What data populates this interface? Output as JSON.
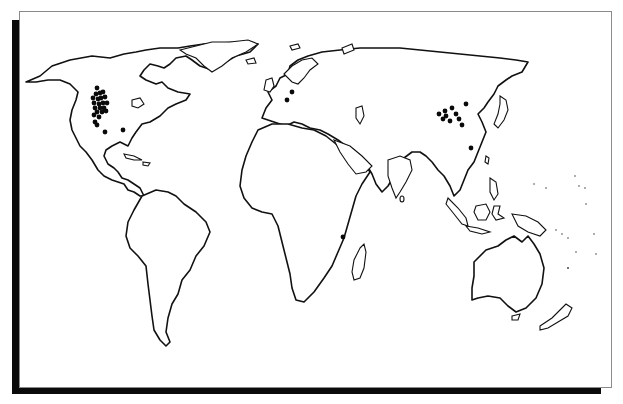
{
  "figure": {
    "type": "world-outline-map",
    "style": "black-and-white line drawing with drop-shadow frame",
    "colors": {
      "background": "#ffffff",
      "outline": "#111111",
      "markers": "#0a0a0a",
      "shadow": "#0a0a0a",
      "border": "#8a8a8a"
    }
  },
  "markers": {
    "description": "Black dot markers indicating site locations",
    "regions": [
      {
        "region": "North America - western interior (Rocky Mountain / Great Plains cluster)",
        "count": 24
      },
      {
        "region": "North America - south-central US",
        "count": 2
      },
      {
        "region": "Europe - northern Italy / Alps",
        "count": 2
      },
      {
        "region": "East Asia - northern China / Mongolia cluster",
        "count": 10
      },
      {
        "region": "East Asia - southeastern China",
        "count": 1
      },
      {
        "region": "Africa - southeastern (Mozambique / Malawi)",
        "count": 1
      }
    ],
    "points": [
      [
        97,
        88
      ],
      [
        96,
        94
      ],
      [
        100,
        93
      ],
      [
        103,
        92
      ],
      [
        93,
        98
      ],
      [
        98,
        99
      ],
      [
        101,
        98
      ],
      [
        105,
        97
      ],
      [
        94,
        103
      ],
      [
        99,
        104
      ],
      [
        103,
        103
      ],
      [
        107,
        103
      ],
      [
        95,
        108
      ],
      [
        100,
        108
      ],
      [
        104,
        108
      ],
      [
        97,
        112
      ],
      [
        102,
        112
      ],
      [
        106,
        111
      ],
      [
        94,
        115
      ],
      [
        99,
        117
      ],
      [
        95,
        122
      ],
      [
        97,
        125
      ],
      [
        105,
        132
      ],
      [
        123,
        130
      ],
      [
        292,
        92
      ],
      [
        287,
        100
      ],
      [
        439,
        114
      ],
      [
        445,
        111
      ],
      [
        446,
        116
      ],
      [
        452,
        108
      ],
      [
        456,
        114
      ],
      [
        443,
        119
      ],
      [
        450,
        121
      ],
      [
        459,
        119
      ],
      [
        466,
        104
      ],
      [
        462,
        125
      ],
      [
        471,
        148
      ],
      [
        343,
        237
      ]
    ]
  }
}
